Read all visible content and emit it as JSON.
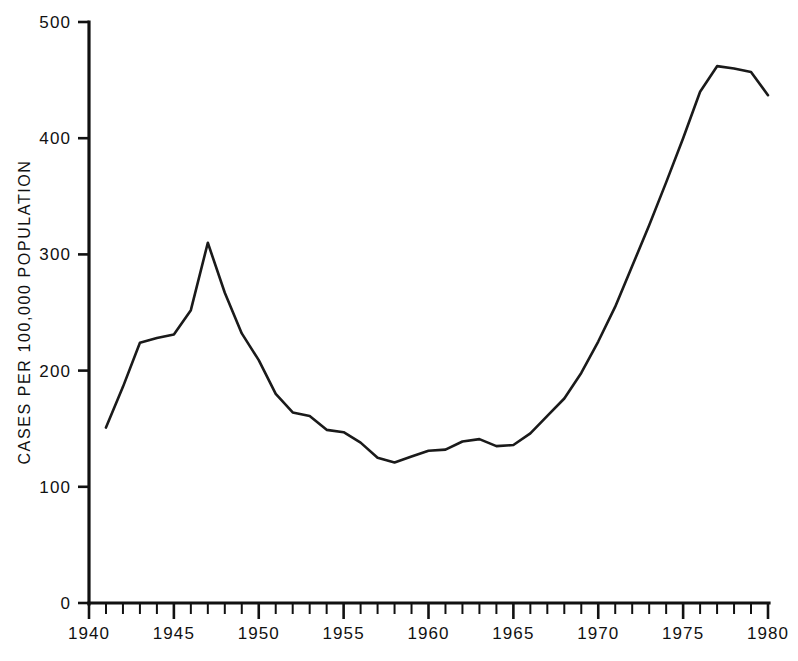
{
  "chart_data": {
    "type": "line",
    "title": "",
    "subtitle": "",
    "xlabel": "",
    "ylabel": "CASES PER 100,000 POPULATION",
    "xlim": [
      1940,
      1980
    ],
    "ylim": [
      0,
      500
    ],
    "grid": false,
    "legend": false,
    "legend_position": "none",
    "x_tick_labels": [
      "1940",
      "1945",
      "1950",
      "1955",
      "1960",
      "1965",
      "1970",
      "1975",
      "1980"
    ],
    "x_tick_values": [
      1940,
      1945,
      1950,
      1955,
      1960,
      1965,
      1970,
      1975,
      1980
    ],
    "x_minor_tick_interval": 1,
    "y_tick_labels": [
      "0",
      "100",
      "200",
      "300",
      "400",
      "500"
    ],
    "y_tick_values": [
      0,
      100,
      200,
      300,
      400,
      500
    ],
    "series": [
      {
        "name": "Cases per 100,000 population",
        "color": "#1a1a1a",
        "x": [
          1941,
          1942,
          1943,
          1944,
          1945,
          1946,
          1947,
          1948,
          1949,
          1950,
          1951,
          1952,
          1953,
          1954,
          1955,
          1956,
          1957,
          1958,
          1959,
          1960,
          1961,
          1962,
          1963,
          1964,
          1965,
          1966,
          1967,
          1968,
          1969,
          1970,
          1971,
          1972,
          1973,
          1974,
          1975,
          1976,
          1977,
          1978,
          1979,
          1980
        ],
        "values": [
          151,
          186,
          224,
          228,
          231,
          252,
          310,
          267,
          232,
          209,
          180,
          164,
          161,
          149,
          147,
          138,
          125,
          121,
          126,
          131,
          132,
          139,
          141,
          135,
          136,
          146,
          161,
          176,
          198,
          225,
          255,
          290,
          325,
          362,
          400,
          440,
          462,
          460,
          457,
          437
        ]
      }
    ]
  },
  "axes": {
    "y_axis_title": "CASES PER 100,000 POPULATION"
  }
}
